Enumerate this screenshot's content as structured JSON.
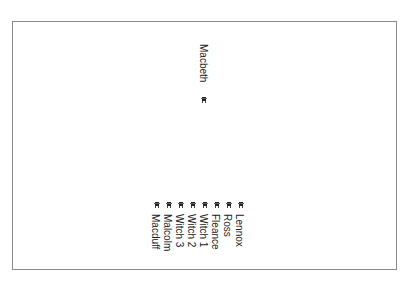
{
  "diagram": {
    "type": "character-graph",
    "border_color": "#8a8a8a",
    "top_node": {
      "label": "Macbeth",
      "x": 209,
      "label_y": 44,
      "icon_x": 201,
      "icon_y": 97
    },
    "bottom_nodes": [
      {
        "label": "Lennox",
        "x": 245,
        "icon_x": 238
      },
      {
        "label": "Ross",
        "x": 233,
        "icon_x": 226
      },
      {
        "label": "Fleance",
        "x": 221,
        "icon_x": 214
      },
      {
        "label": "Witch 1",
        "x": 209,
        "icon_x": 202
      },
      {
        "label": "Witch 2",
        "x": 197,
        "icon_x": 190
      },
      {
        "label": "Witch 3",
        "x": 185,
        "icon_x": 178
      },
      {
        "label": "Malcolm",
        "x": 173,
        "icon_x": 166
      },
      {
        "label": "Macduff",
        "x": 161,
        "icon_x": 154
      }
    ],
    "bottom_icon_y": 202,
    "bottom_label_y": 214
  }
}
